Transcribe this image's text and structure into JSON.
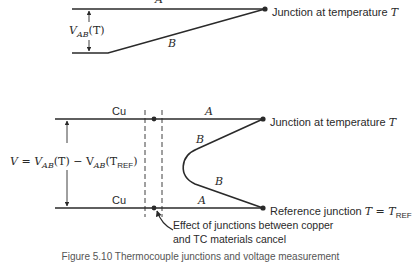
{
  "figure": {
    "top_diagram": {
      "wire_a_label": "A",
      "wire_b_label": "B",
      "voltage_label": {
        "V": "V",
        "sub": "AB",
        "arg": "(T)"
      },
      "junction_label": "Junction at temperature ",
      "junction_symbol": "T"
    },
    "bottom_diagram": {
      "cu_top_label": "Cu",
      "cu_bottom_label": "Cu",
      "wire_a_top_label": "A",
      "wire_a_bottom_label": "A",
      "wire_b_upper_label": "B",
      "wire_b_lower_label": "B",
      "voltage_equation": {
        "lhs": "V = V",
        "sub1": "AB",
        "mid": "(T) − V",
        "sub2": "AB",
        "arg_open": "(T",
        "sub3": "REF",
        "arg_close": ")"
      },
      "junction_hot_label": "Junction at temperature ",
      "junction_hot_symbol": "T",
      "junction_ref_label": "Reference junction ",
      "junction_ref_eq": "T = T",
      "junction_ref_sub": "REF",
      "annotation_line1": "Effect of junctions between copper",
      "annotation_line2": "and TC materials cancel"
    },
    "caption": "Figure 5.10   Thermocouple junctions and voltage measurement"
  }
}
